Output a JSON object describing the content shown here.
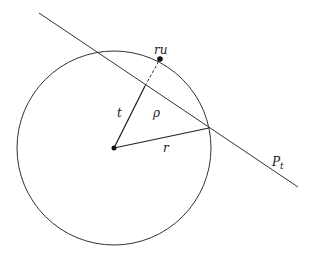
{
  "diagram": {
    "colors": {
      "stroke": "#333333",
      "background": "#ffffff"
    },
    "circle": {
      "cx": 114,
      "cy": 148,
      "r": 97
    },
    "center_point": {
      "x": 114,
      "y": 148
    },
    "plane_line": {
      "x1": 39,
      "y1": 13,
      "x2": 298,
      "y2": 187
    },
    "point_ru": {
      "x": 160,
      "y": 59
    },
    "foot_point": {
      "x": 145,
      "y": 86
    },
    "intersection_point": {
      "x": 209,
      "y": 128
    },
    "labels": {
      "ru": "ru",
      "t": "t",
      "rho": "ρ",
      "r": "r",
      "plane": "P",
      "plane_sub": "t"
    }
  }
}
